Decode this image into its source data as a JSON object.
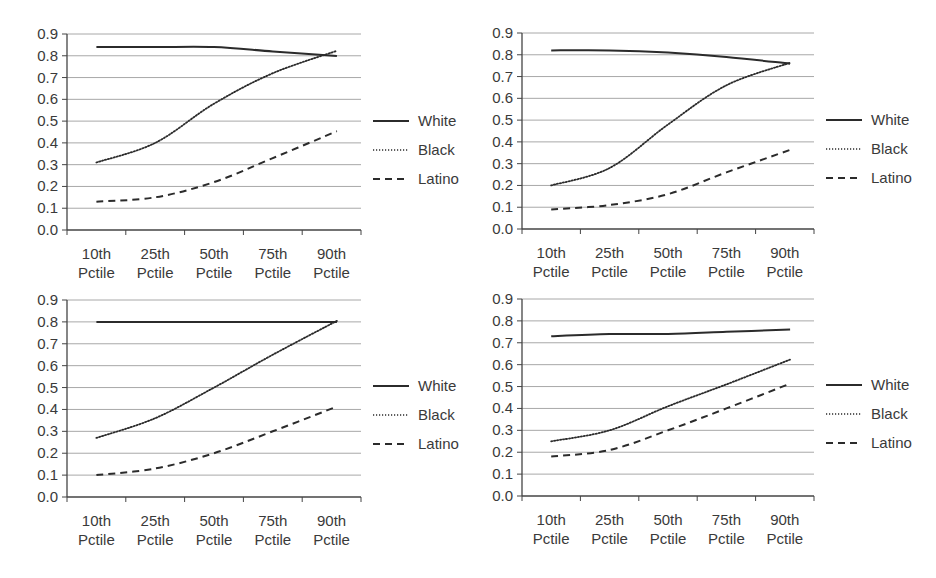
{
  "chart_data": [
    {
      "type": "line",
      "position": "top-left",
      "title": "",
      "xlabel": "",
      "ylabel": "",
      "ylim": [
        0,
        0.9
      ],
      "yticks": [
        "0.0",
        "0.1",
        "0.2",
        "0.3",
        "0.4",
        "0.5",
        "0.6",
        "0.7",
        "0.8",
        "0.9"
      ],
      "grid": true,
      "legend_position": "right",
      "categories": [
        "10th Pctile",
        "25th Pctile",
        "50th Pctile",
        "75th Pctile",
        "90th Pctile"
      ],
      "series": [
        {
          "name": "White",
          "style": "solid",
          "values": [
            0.84,
            0.84,
            0.84,
            0.82,
            0.8
          ]
        },
        {
          "name": "Black",
          "style": "dotted",
          "values": [
            0.31,
            0.4,
            0.58,
            0.72,
            0.82
          ]
        },
        {
          "name": "Latino",
          "style": "dashed",
          "values": [
            0.13,
            0.15,
            0.22,
            0.33,
            0.45
          ]
        }
      ]
    },
    {
      "type": "line",
      "position": "top-right",
      "title": "",
      "xlabel": "",
      "ylabel": "",
      "ylim": [
        0,
        0.9
      ],
      "yticks": [
        "0.0",
        "0.1",
        "0.2",
        "0.3",
        "0.4",
        "0.5",
        "0.6",
        "0.7",
        "0.8",
        "0.9"
      ],
      "grid": true,
      "legend_position": "right",
      "categories": [
        "10th Pctile",
        "25th Pctile",
        "50th Pctile",
        "75th Pctile",
        "90th Pctile"
      ],
      "series": [
        {
          "name": "White",
          "style": "solid",
          "values": [
            0.82,
            0.82,
            0.81,
            0.79,
            0.76
          ]
        },
        {
          "name": "Black",
          "style": "dotted",
          "values": [
            0.2,
            0.28,
            0.48,
            0.66,
            0.76
          ]
        },
        {
          "name": "Latino",
          "style": "dashed",
          "values": [
            0.09,
            0.11,
            0.16,
            0.26,
            0.36
          ]
        }
      ]
    },
    {
      "type": "line",
      "position": "bottom-left",
      "title": "",
      "xlabel": "",
      "ylabel": "",
      "ylim": [
        0,
        0.9
      ],
      "yticks": [
        "0.0",
        "0.1",
        "0.2",
        "0.3",
        "0.4",
        "0.5",
        "0.6",
        "0.7",
        "0.8",
        "0.9"
      ],
      "grid": true,
      "legend_position": "right",
      "categories": [
        "10th Pctile",
        "25th Pctile",
        "50th Pctile",
        "75th Pctile",
        "90th Pctile"
      ],
      "series": [
        {
          "name": "White",
          "style": "solid",
          "values": [
            0.8,
            0.8,
            0.8,
            0.8,
            0.8
          ]
        },
        {
          "name": "Black",
          "style": "dotted",
          "values": [
            0.27,
            0.36,
            0.5,
            0.65,
            0.8
          ]
        },
        {
          "name": "Latino",
          "style": "dashed",
          "values": [
            0.1,
            0.13,
            0.2,
            0.3,
            0.41
          ]
        }
      ]
    },
    {
      "type": "line",
      "position": "bottom-right",
      "title": "",
      "xlabel": "",
      "ylabel": "",
      "ylim": [
        0,
        0.9
      ],
      "yticks": [
        "0.0",
        "0.1",
        "0.2",
        "0.3",
        "0.4",
        "0.5",
        "0.6",
        "0.7",
        "0.8",
        "0.9"
      ],
      "grid": true,
      "legend_position": "right",
      "categories": [
        "10th Pctile",
        "25th Pctile",
        "50th Pctile",
        "75th Pctile",
        "90th Pctile"
      ],
      "series": [
        {
          "name": "White",
          "style": "solid",
          "values": [
            0.73,
            0.74,
            0.74,
            0.75,
            0.76
          ]
        },
        {
          "name": "Black",
          "style": "dotted",
          "values": [
            0.25,
            0.3,
            0.41,
            0.51,
            0.62
          ]
        },
        {
          "name": "Latino",
          "style": "dashed",
          "values": [
            0.18,
            0.21,
            0.3,
            0.4,
            0.51
          ]
        }
      ]
    }
  ],
  "colors": {
    "line": "#2b2b2b",
    "grid": "#a8a8a8",
    "axis": "#444444",
    "text": "#3a3a3a"
  }
}
